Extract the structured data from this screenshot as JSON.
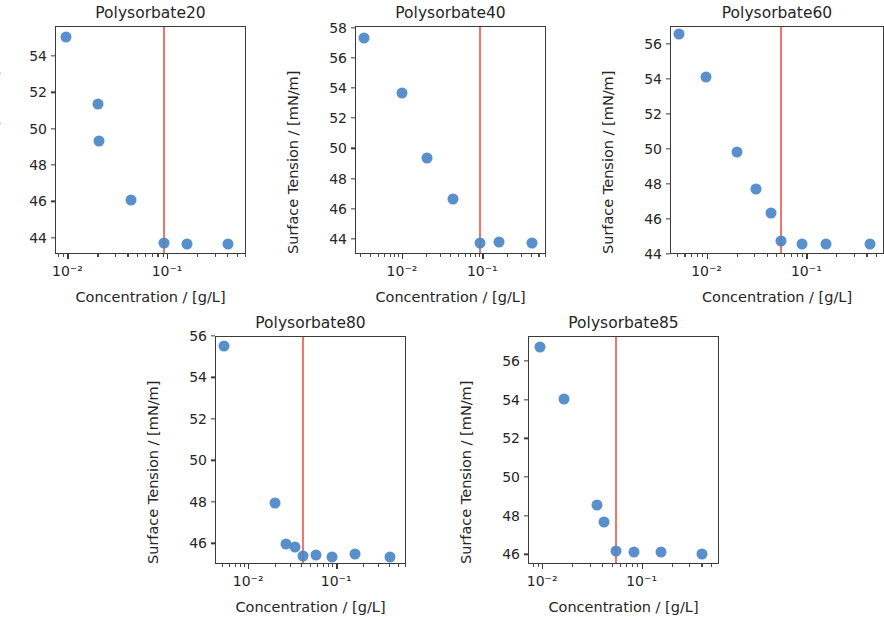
{
  "figure": {
    "kind": "surface-tension-vs-concentration-panel",
    "panel_count": 5,
    "common": {
      "xlabel": "Concentration / [g/L]",
      "ylabel": "Surface Tension / [mN/m]",
      "marker_color": "#4c86c6",
      "cmc_line_color": "#f2685c"
    }
  },
  "chart_data": [
    {
      "type": "scatter",
      "title": "Polysorbate20",
      "xlabel": "Concentration / [g/L]",
      "ylabel": "Surface Tension / [mN/m]",
      "xscale": "log",
      "xlim": [
        0.0075,
        0.62
      ],
      "ylim": [
        43.1,
        55.65
      ],
      "yticks": [
        44,
        46,
        48,
        50,
        52,
        54
      ],
      "xticks": [
        0.01,
        0.1
      ],
      "xtick_labels": [
        "10⁻²",
        "10⁻¹"
      ],
      "grid": false,
      "legend": "none",
      "x": [
        0.0095,
        0.0197,
        0.0202,
        0.0425,
        0.092,
        0.155,
        0.4
      ],
      "y": [
        55.1,
        51.4,
        49.4,
        46.15,
        43.75,
        43.7,
        43.7
      ],
      "annotations": [
        {
          "kind": "vline",
          "label": "cmc",
          "x": 0.092,
          "color": "#f2685c"
        }
      ]
    },
    {
      "type": "scatter",
      "title": "Polysorbate40",
      "xlabel": "Concentration / [g/L]",
      "ylabel": "Surface Tension / [mN/m]",
      "xscale": "log",
      "xlim": [
        0.0026,
        0.62
      ],
      "ylim": [
        43.0,
        58.1
      ],
      "yticks": [
        44,
        46,
        48,
        50,
        52,
        54,
        56,
        58
      ],
      "xticks": [
        0.01,
        0.1
      ],
      "xtick_labels": [
        "10⁻²",
        "10⁻¹"
      ],
      "grid": false,
      "legend": "none",
      "x": [
        0.0033,
        0.0098,
        0.0198,
        0.0415,
        0.091,
        0.155,
        0.4
      ],
      "y": [
        57.4,
        53.75,
        49.45,
        46.7,
        43.8,
        43.85,
        43.8
      ],
      "annotations": [
        {
          "kind": "vline",
          "label": "cmc",
          "x": 0.091,
          "color": "#f2685c"
        }
      ]
    },
    {
      "type": "scatter",
      "title": "Polysorbate60",
      "xlabel": "Concentration / [g/L]",
      "ylabel": "Surface Tension / [mN/m]",
      "xscale": "log",
      "xlim": [
        0.0043,
        0.6
      ],
      "ylim": [
        44.0,
        57.0
      ],
      "yticks": [
        44,
        46,
        48,
        50,
        52,
        54,
        56
      ],
      "xticks": [
        0.01,
        0.1
      ],
      "xtick_labels": [
        "10⁻²",
        "10⁻¹"
      ],
      "grid": false,
      "legend": "none",
      "clipped_right_edge": true,
      "x": [
        0.0052,
        0.0097,
        0.0198,
        0.0305,
        0.0435,
        0.054,
        0.088,
        0.155,
        0.42
      ],
      "y": [
        56.6,
        54.15,
        49.9,
        47.75,
        46.4,
        44.8,
        44.65,
        44.6,
        44.6
      ],
      "annotations": [
        {
          "kind": "vline",
          "label": "cmc",
          "x": 0.054,
          "color": "#f2685c"
        }
      ]
    },
    {
      "type": "scatter",
      "title": "Polysorbate80",
      "xlabel": "Concentration / [g/L]",
      "ylabel": "Surface Tension / [mN/m]",
      "xscale": "log",
      "xlim": [
        0.0042,
        0.62
      ],
      "ylim": [
        45.0,
        56.0
      ],
      "yticks": [
        46,
        48,
        50,
        52,
        54,
        56
      ],
      "xticks": [
        0.01,
        0.1
      ],
      "xtick_labels": [
        "10⁻²",
        "10⁻¹"
      ],
      "grid": false,
      "legend": "none",
      "x": [
        0.0052,
        0.0198,
        0.0262,
        0.0332,
        0.0405,
        0.057,
        0.088,
        0.158,
        0.4
      ],
      "y": [
        55.55,
        48.0,
        46.0,
        45.85,
        45.45,
        45.5,
        45.4,
        45.55,
        45.4
      ],
      "annotations": [
        {
          "kind": "vline",
          "label": "cmc",
          "x": 0.0405,
          "color": "#f2685c"
        }
      ]
    },
    {
      "type": "scatter",
      "title": "Polysorbate85",
      "xlabel": "Concentration / [g/L]",
      "ylabel": "Surface Tension / [mN/m]",
      "xscale": "log",
      "xlim": [
        0.0072,
        0.6
      ],
      "ylim": [
        45.5,
        57.3
      ],
      "yticks": [
        46,
        48,
        50,
        52,
        54,
        56
      ],
      "xticks": [
        0.01,
        0.1
      ],
      "xtick_labels": [
        "10⁻²",
        "10⁻¹"
      ],
      "grid": false,
      "legend": "none",
      "x": [
        0.0093,
        0.0162,
        0.0345,
        0.0405,
        0.0545,
        0.082,
        0.152,
        0.4
      ],
      "y": [
        56.8,
        54.1,
        48.6,
        47.7,
        46.2,
        46.15,
        46.15,
        46.05
      ],
      "annotations": [
        {
          "kind": "vline",
          "label": "cmc",
          "x": 0.0545,
          "color": "#f2685c"
        }
      ]
    }
  ],
  "panel_geometry": [
    {
      "left": 18,
      "top": 4,
      "plot_left": 55,
      "plot_top": 26,
      "plot_w": 191,
      "plot_h": 228
    },
    {
      "left": 318,
      "top": 4,
      "plot_left": 355,
      "plot_top": 26,
      "plot_w": 191,
      "plot_h": 228
    },
    {
      "left": 618,
      "top": 4,
      "plot_left": 670,
      "plot_top": 26,
      "plot_w": 214,
      "plot_h": 228
    },
    {
      "left": 168,
      "top": 314,
      "plot_left": 215,
      "plot_top": 336,
      "plot_w": 191,
      "plot_h": 228
    },
    {
      "left": 468,
      "top": 314,
      "plot_left": 528,
      "plot_top": 336,
      "plot_w": 191,
      "plot_h": 228
    }
  ]
}
